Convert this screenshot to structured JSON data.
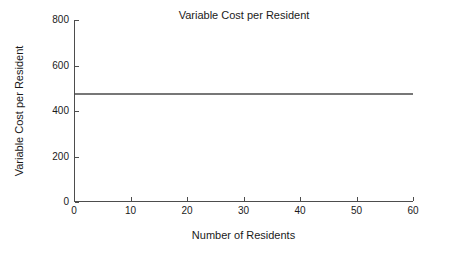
{
  "chart_data": {
    "type": "line",
    "title": "Variable Cost per Resident",
    "xlabel": "Number of Residents",
    "ylabel": "Variable Cost per Resident",
    "xlim": [
      0,
      60
    ],
    "ylim": [
      0,
      800
    ],
    "xticks": [
      0,
      10,
      20,
      30,
      40,
      50,
      60
    ],
    "yticks": [
      0,
      200,
      400,
      600,
      800
    ],
    "xtick_labels": [
      "0",
      "10",
      "20",
      "30",
      "40",
      "50",
      "60"
    ],
    "ytick_labels": [
      "0",
      "200",
      "400",
      "600",
      "800"
    ],
    "grid": false,
    "legend": false,
    "legend_position": "none",
    "series": [
      {
        "name": "Variable cost per resident",
        "color": "#4a4a4a",
        "x": [
          0,
          10,
          20,
          30,
          40,
          50,
          60
        ],
        "values": [
          475,
          475,
          475,
          475,
          475,
          475,
          475
        ]
      }
    ]
  }
}
